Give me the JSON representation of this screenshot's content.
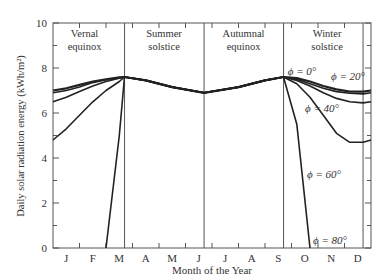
{
  "chart_data": {
    "type": "line",
    "title": "",
    "xlabel": "Month of the Year",
    "ylabel": "Daily solar radiation energy (kWh/m²)",
    "ylim": [
      0,
      10
    ],
    "yticks": [
      0,
      2,
      4,
      6,
      8,
      10
    ],
    "x_tick_labels": [
      "J",
      "F",
      "M",
      "A",
      "M",
      "J",
      "J",
      "A",
      "S",
      "O",
      "N",
      "D"
    ],
    "grid": false,
    "legend_position": "inline annotations",
    "markers": [
      {
        "label_line1": "Vernal",
        "label_line2": "equinox",
        "x_month": 2.7
      },
      {
        "label_line1": "Summer",
        "label_line2": "solstice",
        "x_month": 5.7
      },
      {
        "label_line1": "Autumnal",
        "label_line2": "equinox",
        "x_month": 8.7
      },
      {
        "label_line1": "Winter",
        "label_line2": "solstice",
        "x_month": 11.7
      }
    ],
    "x": [
      0,
      0.5,
      1,
      1.5,
      2,
      2.5,
      2.7,
      3.5,
      4.5,
      5.7,
      7,
      8,
      8.7,
      9.2,
      9.7,
      10.2,
      10.7,
      11.2,
      11.7,
      12
    ],
    "series": [
      {
        "name": "ϕ = 0°",
        "values": [
          7.0,
          7.1,
          7.25,
          7.4,
          7.5,
          7.58,
          7.6,
          7.45,
          7.15,
          6.9,
          7.15,
          7.45,
          7.6,
          7.55,
          7.4,
          7.2,
          7.05,
          6.95,
          6.95,
          7.0
        ]
      },
      {
        "name": "ϕ = 20°",
        "values": [
          6.9,
          7.0,
          7.15,
          7.35,
          7.48,
          7.57,
          7.6,
          7.45,
          7.15,
          6.9,
          7.15,
          7.45,
          7.6,
          7.5,
          7.3,
          7.1,
          6.95,
          6.88,
          6.85,
          6.9
        ]
      },
      {
        "name": "ϕ = 40°",
        "values": [
          6.5,
          6.7,
          6.95,
          7.2,
          7.4,
          7.55,
          7.6,
          7.45,
          7.15,
          6.9,
          7.15,
          7.45,
          7.6,
          7.45,
          7.2,
          6.9,
          6.65,
          6.5,
          6.45,
          6.5
        ]
      },
      {
        "name": "ϕ = 60°",
        "values": [
          4.8,
          5.3,
          5.9,
          6.5,
          7.0,
          7.4,
          7.6,
          7.45,
          7.15,
          6.9,
          7.15,
          7.45,
          7.6,
          7.3,
          6.7,
          5.9,
          5.1,
          4.7,
          4.7,
          4.8
        ]
      },
      {
        "name": "ϕ = 80°",
        "values": [
          null,
          null,
          null,
          null,
          0.0,
          5.0,
          7.6,
          7.45,
          7.15,
          6.9,
          7.15,
          7.45,
          7.6,
          5.5,
          0.0,
          null,
          null,
          null,
          null,
          null
        ]
      }
    ]
  }
}
